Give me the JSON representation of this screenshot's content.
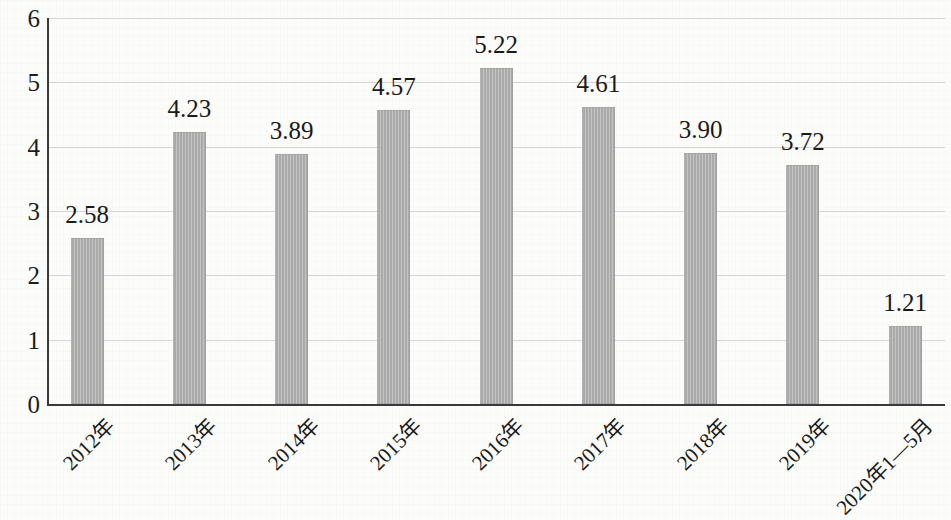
{
  "chart_data": {
    "type": "bar",
    "title": "",
    "subtitle": "",
    "xlabel": "",
    "ylabel": "",
    "categories": [
      "2012年",
      "2013年",
      "2014年",
      "2015年",
      "2016年",
      "2017年",
      "2018年",
      "2019年",
      "2020年1—5月"
    ],
    "values": [
      2.58,
      4.23,
      3.89,
      4.57,
      5.22,
      4.61,
      3.9,
      3.72,
      1.21
    ],
    "data_labels": [
      "2.58",
      "4.23",
      "3.89",
      "4.57",
      "5.22",
      "4.61",
      "3.90",
      "3.72",
      "1.21"
    ],
    "ylim": [
      0,
      6
    ],
    "ytick_labels": [
      "6",
      "5",
      "4",
      "3",
      "2",
      "1",
      "0"
    ],
    "ytick_values": [
      6,
      5,
      4,
      3,
      2,
      1,
      0
    ],
    "grid": true,
    "grid_axis": "y",
    "legend": false,
    "legend_position": "none",
    "series": [
      {
        "name": "",
        "values": [
          2.58,
          4.23,
          3.89,
          4.57,
          5.22,
          4.61,
          3.9,
          3.72,
          1.21
        ]
      }
    ],
    "colors": {
      "bar_fill": "#aaaaaa",
      "axis": "#3a3a3a",
      "gridline": "#d5d5d5",
      "text": "#1a1a1a",
      "background": "#fcfcfb"
    }
  }
}
